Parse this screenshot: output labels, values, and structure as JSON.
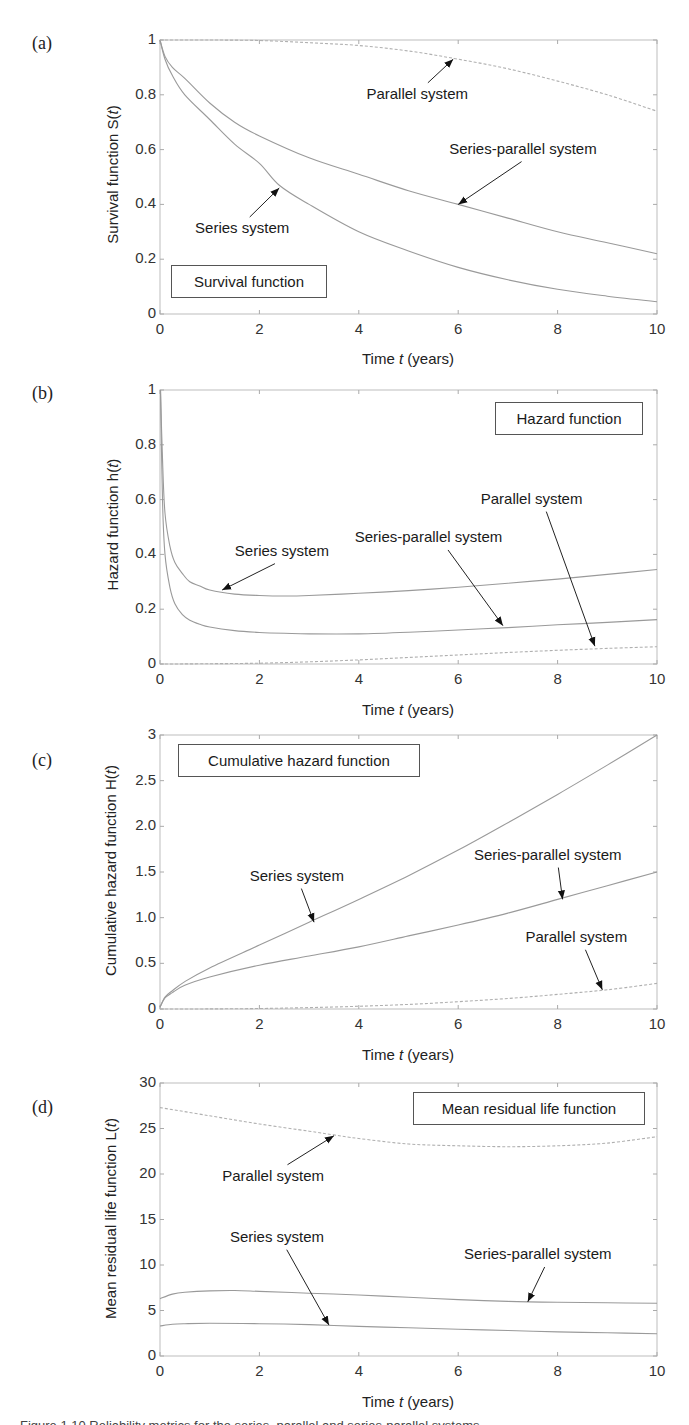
{
  "figure": {
    "caption_partial": "Figure 1.10  Reliability metrics for the series, parallel and series-parallel systems"
  },
  "chart_data": [
    {
      "id": "a",
      "type": "line",
      "panel_letter": "(a)",
      "title": "Survival function",
      "xlabel": "Time t (years)",
      "xlabel_parts": [
        "Time ",
        "t",
        " (years)"
      ],
      "ylabel": "Survival function S(t)",
      "ylabel_parts": [
        "Survival function S(",
        "t",
        ")"
      ],
      "xlim": [
        0,
        10
      ],
      "ylim": [
        0,
        1
      ],
      "xticks": [
        0,
        2,
        4,
        6,
        8,
        10
      ],
      "yticks": [
        0,
        0.2,
        0.4,
        0.6,
        0.8,
        1
      ],
      "ytick_labels": [
        "0",
        "0.2",
        "0.4",
        "0.6",
        "0.8",
        "1"
      ],
      "grid": false,
      "legend": "none (inline annotations)",
      "series": [
        {
          "name": "Series system",
          "style": "solid",
          "x": [
            0,
            0.1,
            0.25,
            0.5,
            1,
            1.5,
            2,
            2.4,
            3,
            4,
            5,
            6,
            7,
            8,
            9,
            10
          ],
          "values": [
            1,
            0.93,
            0.87,
            0.8,
            0.71,
            0.62,
            0.55,
            0.47,
            0.4,
            0.3,
            0.23,
            0.17,
            0.125,
            0.09,
            0.065,
            0.045
          ]
        },
        {
          "name": "Series-parallel system",
          "style": "solid",
          "x": [
            0,
            0.1,
            0.25,
            0.5,
            1,
            1.5,
            2,
            3,
            4,
            5,
            6,
            7,
            8,
            9,
            10
          ],
          "values": [
            1,
            0.94,
            0.9,
            0.86,
            0.77,
            0.7,
            0.65,
            0.57,
            0.51,
            0.45,
            0.4,
            0.35,
            0.3,
            0.26,
            0.22
          ]
        },
        {
          "name": "Parallel system",
          "style": "dashed",
          "x": [
            0,
            1,
            2,
            3,
            4,
            5,
            6,
            7,
            8,
            9,
            10
          ],
          "values": [
            1,
            1,
            0.998,
            0.99,
            0.98,
            0.96,
            0.93,
            0.895,
            0.85,
            0.8,
            0.74
          ]
        }
      ],
      "annotations": [
        {
          "text": "Parallel system",
          "label_xy": [
            5.3,
            0.8
          ],
          "arrow_to": [
            5.9,
            0.93
          ]
        },
        {
          "text": "Series-parallel system",
          "label_xy": [
            7.5,
            0.6
          ],
          "arrow_to": [
            6.0,
            0.4
          ]
        },
        {
          "text": "Series system",
          "label_xy": [
            1.7,
            0.31
          ],
          "arrow_to": [
            2.4,
            0.46
          ]
        }
      ]
    },
    {
      "id": "b",
      "type": "line",
      "panel_letter": "(b)",
      "title": "Hazard function",
      "xlabel": "Time t (years)",
      "xlabel_parts": [
        "Time ",
        "t",
        " (years)"
      ],
      "ylabel": "Hazard function h(t)",
      "ylabel_parts": [
        "Hazard function h(",
        "t",
        ")"
      ],
      "xlim": [
        0,
        10
      ],
      "ylim": [
        0,
        1
      ],
      "xticks": [
        0,
        2,
        4,
        6,
        8,
        10
      ],
      "yticks": [
        0,
        0.2,
        0.4,
        0.6,
        0.8,
        1
      ],
      "ytick_labels": [
        "0",
        "0.2",
        "0.4",
        "0.6",
        "0.8",
        "1"
      ],
      "grid": false,
      "series": [
        {
          "name": "Series system",
          "style": "solid",
          "x": [
            0.01,
            0.05,
            0.1,
            0.2,
            0.3,
            0.45,
            0.6,
            0.8,
            1,
            1.5,
            2,
            2.5,
            3,
            4,
            5,
            6,
            7,
            8,
            9,
            10
          ],
          "values": [
            1.0,
            0.75,
            0.55,
            0.43,
            0.37,
            0.33,
            0.3,
            0.285,
            0.27,
            0.255,
            0.25,
            0.248,
            0.25,
            0.258,
            0.268,
            0.28,
            0.295,
            0.31,
            0.327,
            0.345
          ]
        },
        {
          "name": "Series-parallel system",
          "style": "solid",
          "x": [
            0.01,
            0.05,
            0.1,
            0.2,
            0.3,
            0.45,
            0.6,
            0.8,
            1,
            1.5,
            2,
            2.5,
            3,
            4,
            5,
            6,
            7,
            8,
            9,
            10
          ],
          "values": [
            1.0,
            0.6,
            0.4,
            0.28,
            0.22,
            0.18,
            0.16,
            0.145,
            0.135,
            0.122,
            0.115,
            0.112,
            0.11,
            0.11,
            0.116,
            0.124,
            0.133,
            0.143,
            0.152,
            0.162
          ]
        },
        {
          "name": "Parallel system",
          "style": "dashed",
          "x": [
            0,
            1,
            2,
            3,
            4,
            5,
            6,
            7,
            8,
            9,
            10
          ],
          "values": [
            0,
            0.001,
            0.003,
            0.008,
            0.015,
            0.024,
            0.033,
            0.042,
            0.05,
            0.057,
            0.063
          ]
        }
      ],
      "annotations": [
        {
          "text": "Series system",
          "label_xy": [
            2.5,
            0.41
          ],
          "arrow_to": [
            1.25,
            0.27
          ]
        },
        {
          "text": "Series-parallel system",
          "label_xy": [
            5.6,
            0.46
          ],
          "arrow_to": [
            6.9,
            0.14
          ]
        },
        {
          "text": "Parallel system",
          "label_xy": [
            7.6,
            0.6
          ],
          "arrow_to": [
            8.75,
            0.065
          ]
        }
      ]
    },
    {
      "id": "c",
      "type": "line",
      "panel_letter": "(c)",
      "title": "Cumulative hazard function",
      "xlabel": "Time t (years)",
      "xlabel_parts": [
        "Time ",
        "t",
        " (years)"
      ],
      "ylabel": "Cumulative hazard function H(t)",
      "ylabel_parts": [
        "Cumulative hazard function H(",
        "t",
        ")"
      ],
      "xlim": [
        0,
        10
      ],
      "ylim": [
        0,
        3
      ],
      "xticks": [
        0,
        2,
        4,
        6,
        8,
        10
      ],
      "yticks": [
        0,
        0.5,
        1.0,
        1.5,
        2.0,
        2.5,
        3
      ],
      "ytick_labels": [
        "0",
        "0.5",
        "1.0",
        "1.5",
        "2.0",
        "2.5",
        "3"
      ],
      "grid": false,
      "series": [
        {
          "name": "Series system",
          "style": "solid",
          "x": [
            0,
            0.1,
            0.25,
            0.5,
            1,
            2,
            3,
            4,
            5,
            6,
            7,
            8,
            9,
            10
          ],
          "values": [
            0.02,
            0.13,
            0.2,
            0.3,
            0.45,
            0.7,
            0.95,
            1.2,
            1.46,
            1.74,
            2.04,
            2.35,
            2.67,
            3.0
          ]
        },
        {
          "name": "Series-parallel system",
          "style": "solid",
          "x": [
            0,
            0.1,
            0.25,
            0.5,
            1,
            2,
            3,
            4,
            5,
            6,
            7,
            8,
            9,
            10
          ],
          "values": [
            0.02,
            0.12,
            0.18,
            0.26,
            0.35,
            0.48,
            0.58,
            0.68,
            0.8,
            0.92,
            1.05,
            1.2,
            1.35,
            1.5
          ]
        },
        {
          "name": "Parallel system",
          "style": "dashed",
          "x": [
            0,
            1,
            2,
            3,
            4,
            5,
            6,
            7,
            8,
            9,
            10
          ],
          "values": [
            0,
            0.001,
            0.005,
            0.015,
            0.03,
            0.05,
            0.08,
            0.115,
            0.16,
            0.21,
            0.28
          ]
        }
      ],
      "annotations": [
        {
          "text": "Series system",
          "label_xy": [
            2.8,
            1.45
          ],
          "arrow_to": [
            3.1,
            0.95
          ]
        },
        {
          "text": "Series-parallel system",
          "label_xy": [
            8.0,
            1.68
          ],
          "arrow_to": [
            8.1,
            1.2
          ]
        },
        {
          "text": "Parallel system",
          "label_xy": [
            8.5,
            0.78
          ],
          "arrow_to": [
            8.9,
            0.21
          ]
        }
      ]
    },
    {
      "id": "d",
      "type": "line",
      "panel_letter": "(d)",
      "title": "Mean residual life function",
      "xlabel": "Time t (years)",
      "xlabel_parts": [
        "Time ",
        "t",
        " (years)"
      ],
      "ylabel": "Mean residual life function L(t)",
      "ylabel_parts": [
        "Mean residual life function L(",
        "t",
        ")"
      ],
      "xlim": [
        0,
        10
      ],
      "ylim": [
        0,
        30
      ],
      "xticks": [
        0,
        2,
        4,
        6,
        8,
        10
      ],
      "yticks": [
        0,
        5,
        10,
        15,
        20,
        25,
        30
      ],
      "ytick_labels": [
        "0",
        "5",
        "10",
        "15",
        "20",
        "25",
        "30"
      ],
      "grid": false,
      "series": [
        {
          "name": "Parallel system",
          "style": "dashed",
          "x": [
            0,
            1,
            2,
            3,
            3.5,
            4,
            5,
            6,
            7,
            8,
            9,
            10
          ],
          "values": [
            27.3,
            26.4,
            25.5,
            24.7,
            24.3,
            23.9,
            23.3,
            23.1,
            23.0,
            23.1,
            23.4,
            24.1
          ]
        },
        {
          "name": "Series-parallel system",
          "style": "solid",
          "x": [
            0,
            0.25,
            0.5,
            1,
            1.5,
            2,
            3,
            4,
            5,
            6,
            7,
            8,
            9,
            10
          ],
          "values": [
            6.3,
            6.8,
            7.0,
            7.15,
            7.2,
            7.1,
            6.9,
            6.7,
            6.45,
            6.2,
            6.0,
            5.9,
            5.85,
            5.8
          ]
        },
        {
          "name": "Series system",
          "style": "solid",
          "x": [
            0,
            0.25,
            0.5,
            1,
            2,
            3,
            4,
            5,
            6,
            7,
            8,
            9,
            10
          ],
          "values": [
            3.3,
            3.5,
            3.55,
            3.6,
            3.55,
            3.45,
            3.25,
            3.1,
            2.95,
            2.8,
            2.65,
            2.55,
            2.45
          ]
        }
      ],
      "annotations": [
        {
          "text": "Parallel system",
          "label_xy": [
            2.4,
            19.7
          ],
          "arrow_to": [
            3.5,
            24.2
          ]
        },
        {
          "text": "Series system",
          "label_xy": [
            2.4,
            13.0
          ],
          "arrow_to": [
            3.4,
            3.4
          ]
        },
        {
          "text": "Series-parallel system",
          "label_xy": [
            7.8,
            11.1
          ],
          "arrow_to": [
            7.4,
            5.95
          ]
        }
      ]
    }
  ]
}
